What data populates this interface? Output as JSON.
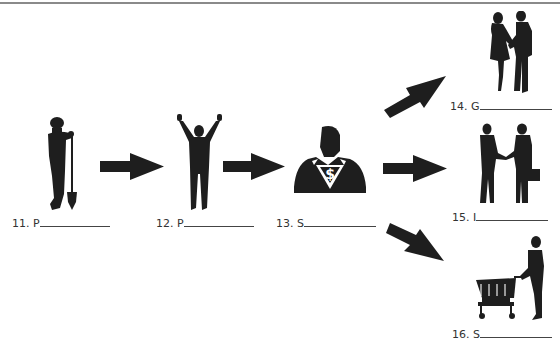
{
  "worksheet": {
    "colors": {
      "ink": "#1e1e1e",
      "rule": "#8a8a8a",
      "background": "#ffffff"
    },
    "items": [
      {
        "number": "11.",
        "letter": "P",
        "icon": "person-with-shovel-icon"
      },
      {
        "number": "12.",
        "letter": "P",
        "icon": "person-arms-raised-icon"
      },
      {
        "number": "13.",
        "letter": "S",
        "icon": "superhero-businessman-dollar-icon"
      },
      {
        "number": "14.",
        "letter": "G",
        "icon": "couple-holding-hands-icon"
      },
      {
        "number": "15.",
        "letter": "I",
        "icon": "business-handshake-icon"
      },
      {
        "number": "16.",
        "letter": "S",
        "icon": "shopper-with-cart-icon"
      }
    ],
    "arrows": [
      {
        "from": "11",
        "to": "12",
        "direction": "right"
      },
      {
        "from": "12",
        "to": "13",
        "direction": "right"
      },
      {
        "from": "13",
        "to": "14",
        "direction": "up-right"
      },
      {
        "from": "13",
        "to": "15",
        "direction": "right"
      },
      {
        "from": "13",
        "to": "16",
        "direction": "down-right"
      }
    ]
  }
}
